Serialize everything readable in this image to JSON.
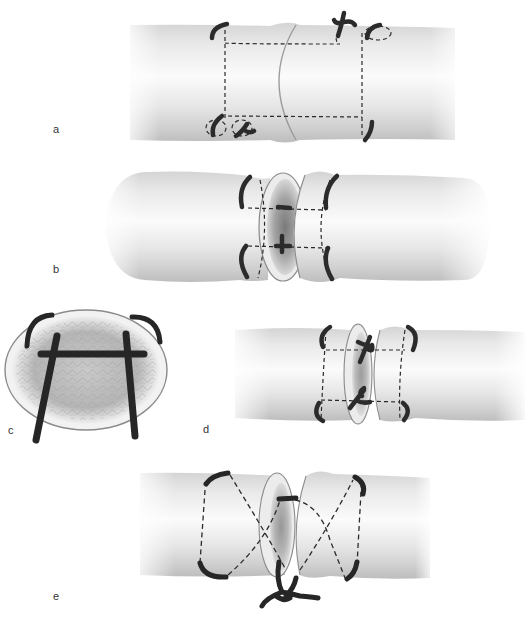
{
  "figure": {
    "colors": {
      "vessel_light": "#f4f4f4",
      "vessel_mid": "#d2d2d2",
      "vessel_dark": "#a8a8a8",
      "suture": "#2a2a2a",
      "lumen": "#8c8c8c",
      "rim": "#e9e9e9",
      "label": "#333333"
    },
    "panels": [
      {
        "id": "a",
        "label": "a",
        "description": "Two parallel sutures across the cut, knots on surface, dashed suture path"
      },
      {
        "id": "b",
        "label": "b",
        "description": "Stumps separated, sutures passing through cut face"
      },
      {
        "id": "c",
        "label": "c",
        "description": "Cross-section view of cut face with H-shaped suture"
      },
      {
        "id": "d",
        "label": "d",
        "description": "Stumps approximated, knots tied at cut ends"
      },
      {
        "id": "e",
        "label": "e",
        "description": "Figure-of-eight crossing suture tied below"
      }
    ]
  }
}
